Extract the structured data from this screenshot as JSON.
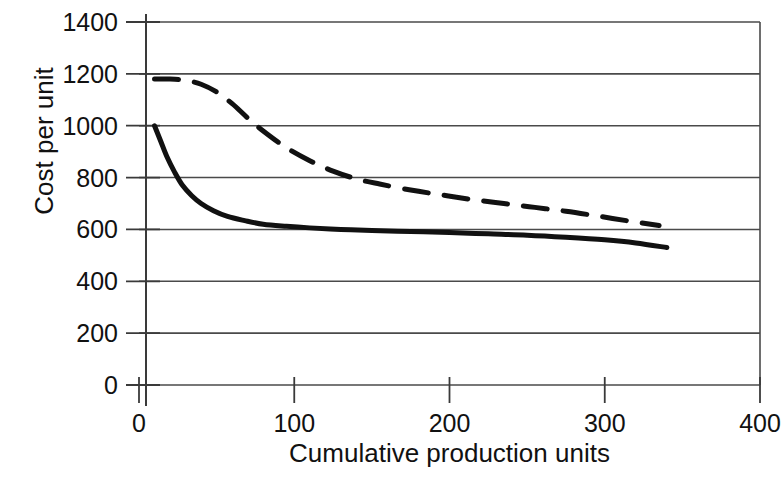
{
  "chart_data": {
    "type": "line",
    "title": "",
    "xlabel": "Cumulative production units",
    "ylabel": "Cost per unit",
    "xlim": [
      0,
      400
    ],
    "ylim": [
      0,
      1400
    ],
    "xticks": [
      "0",
      "100",
      "200",
      "300",
      "400"
    ],
    "xtick_values": [
      0,
      100,
      200,
      300,
      400
    ],
    "yticks": [
      "0",
      "200",
      "400",
      "600",
      "800",
      "1000",
      "1200",
      "1400"
    ],
    "ytick_values": [
      0,
      200,
      400,
      600,
      800,
      1000,
      1200,
      1400
    ],
    "grid": "horizontal",
    "legend": "none",
    "series": [
      {
        "name": "solid-curve",
        "style": "solid",
        "color": "#111111",
        "x": [
          10,
          14,
          18,
          23,
          28,
          34,
          40,
          48,
          57,
          68,
          80,
          95,
          110,
          130,
          150,
          175,
          200,
          225,
          250,
          275,
          300,
          320,
          340
        ],
        "y": [
          1000,
          940,
          880,
          820,
          770,
          730,
          700,
          672,
          650,
          634,
          620,
          612,
          606,
          600,
          596,
          592,
          588,
          583,
          578,
          570,
          560,
          548,
          530
        ]
      },
      {
        "name": "dashed-curve",
        "style": "dashed",
        "color": "#111111",
        "x": [
          10,
          20,
          30,
          40,
          50,
          60,
          70,
          80,
          95,
          110,
          125,
          140,
          155,
          175,
          195,
          215,
          235,
          255,
          275,
          295,
          315,
          335
        ],
        "y": [
          1180,
          1180,
          1175,
          1160,
          1130,
          1085,
          1030,
          980,
          915,
          865,
          825,
          795,
          775,
          752,
          733,
          715,
          700,
          685,
          670,
          652,
          633,
          615
        ]
      }
    ]
  },
  "axes": {
    "y_title": "Cost per unit",
    "x_title": "Cumulative production units"
  },
  "colors": {
    "plot_line": "#111111",
    "grid": "#4a4a4a",
    "axis": "#3a3a3a",
    "background": "#ffffff"
  }
}
